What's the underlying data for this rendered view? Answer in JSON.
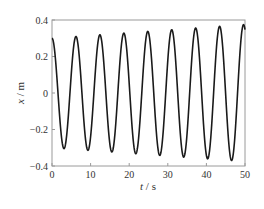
{
  "chart_data": {
    "type": "line",
    "title": "",
    "xlabel": "t / s",
    "ylabel": "x / m",
    "xlim": [
      0,
      50
    ],
    "ylim": [
      -0.4,
      0.4
    ],
    "xticks": [
      0,
      10,
      20,
      30,
      40,
      50
    ],
    "xtick_labels": [
      "0",
      "10",
      "20",
      "30",
      "40",
      "50"
    ],
    "yticks": [
      0.4,
      0.2,
      0,
      -0.2,
      -0.4
    ],
    "ytick_labels": [
      "0.4",
      "0.2",
      "0",
      "−0.2",
      "−0.4"
    ],
    "grid": false,
    "legend": null,
    "series": [
      {
        "name": "x(t)",
        "color": "#1a1a1a",
        "description": "Oscillation with slowly growing amplitude; period ~6.2 s",
        "model": {
          "form": "A(t)*cos(omega*t)",
          "A0": 0.3,
          "A_end": 0.375,
          "omega": 1.013
        },
        "peaks": [
          {
            "t": 0.0,
            "x": 0.3
          },
          {
            "t": 6.2,
            "x": 0.307
          },
          {
            "t": 12.4,
            "x": 0.318
          },
          {
            "t": 18.6,
            "x": 0.323
          },
          {
            "t": 24.8,
            "x": 0.329
          },
          {
            "t": 31.1,
            "x": 0.351
          },
          {
            "t": 37.3,
            "x": 0.356
          },
          {
            "t": 43.5,
            "x": 0.373
          },
          {
            "t": 49.7,
            "x": 0.375
          }
        ],
        "troughs": [
          {
            "t": 3.4,
            "x": -0.307
          },
          {
            "t": 9.6,
            "x": -0.312
          },
          {
            "t": 15.8,
            "x": -0.323
          },
          {
            "t": 22.0,
            "x": -0.329
          },
          {
            "t": 28.2,
            "x": -0.34
          },
          {
            "t": 34.4,
            "x": -0.351
          },
          {
            "t": 40.6,
            "x": -0.362
          },
          {
            "t": 46.8,
            "x": -0.378
          }
        ]
      }
    ]
  },
  "axes": {
    "x_label_var": "t",
    "x_label_unit": "s",
    "y_label_var": "x",
    "y_label_unit": "m"
  }
}
